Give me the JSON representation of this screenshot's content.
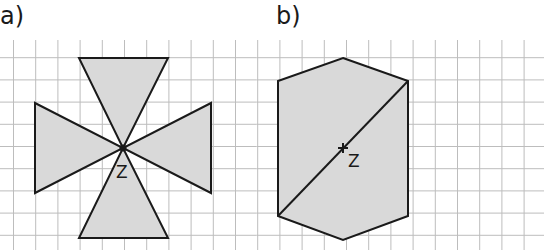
{
  "panels": [
    {
      "label": "a)",
      "center_label": "Z",
      "shape": "four triangles meeting at center point Z (point-symmetric cross)",
      "triangles": [
        {
          "name": "top",
          "points": [
            [
              79,
              58
            ],
            [
              168,
              58
            ],
            [
              123,
              148
            ]
          ]
        },
        {
          "name": "bottom",
          "points": [
            [
              79,
              238
            ],
            [
              168,
              238
            ],
            [
              123,
              148
            ]
          ]
        },
        {
          "name": "left",
          "points": [
            [
              35,
              103
            ],
            [
              35,
              193
            ],
            [
              123,
              148
            ]
          ]
        },
        {
          "name": "right",
          "points": [
            [
              211,
              103
            ],
            [
              211,
              193
            ],
            [
              123,
              148
            ]
          ]
        }
      ],
      "center": [
        123,
        148
      ]
    },
    {
      "label": "b)",
      "center_label": "Z",
      "shape": "hexagon with diagonal through center point Z",
      "hexagon": [
        [
          343,
          58
        ],
        [
          408,
          81
        ],
        [
          408,
          216
        ],
        [
          343,
          240
        ],
        [
          278,
          216
        ],
        [
          278,
          81
        ]
      ],
      "diagonal": [
        [
          278,
          216
        ],
        [
          408,
          81
        ]
      ],
      "center": [
        343,
        148
      ]
    }
  ],
  "colors": {
    "fill": "#d9d9d9",
    "stroke": "#1a1a1a",
    "grid": "#bdbdbd"
  },
  "grid": {
    "spacing": 22.2,
    "x_start": 13.5,
    "y_start": 35.5
  }
}
